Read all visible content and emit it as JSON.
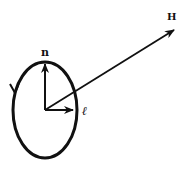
{
  "diagram": {
    "type": "vector-diagram",
    "labels": {
      "normal": "n",
      "angular_momentum": "ℓ",
      "field": "H"
    },
    "elements": [
      {
        "id": "orbit",
        "shape": "ellipse",
        "direction": "counterclockwise-arrow-on-left-side"
      },
      {
        "id": "n-vector",
        "label": "n",
        "direction": "up"
      },
      {
        "id": "l-vector",
        "label": "ℓ",
        "direction": "right"
      },
      {
        "id": "H-vector",
        "label": "H",
        "direction": "up-right"
      }
    ],
    "colors": {
      "stroke": "#111111",
      "background": "#ffffff"
    }
  }
}
